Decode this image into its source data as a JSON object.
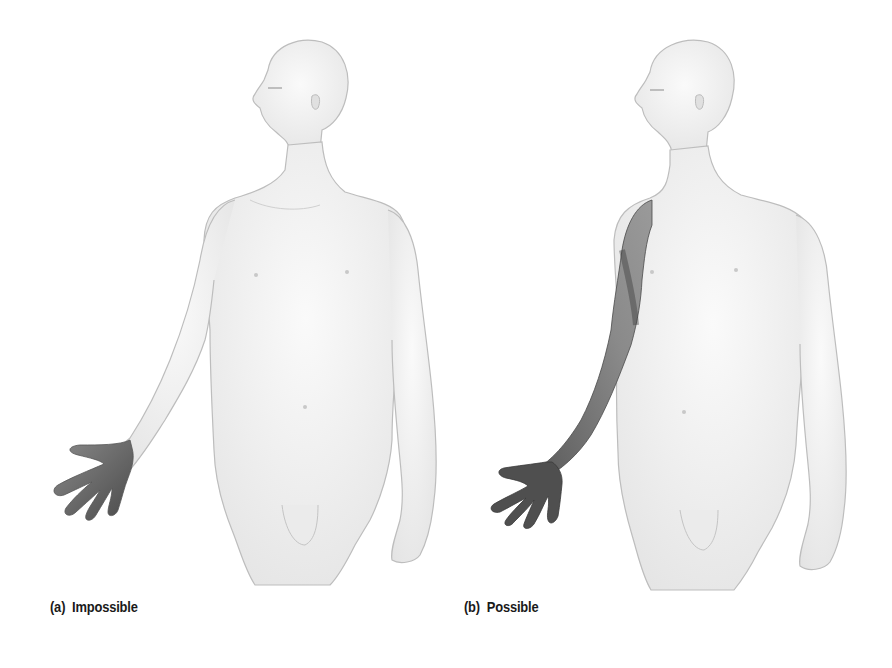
{
  "figure": {
    "panels": [
      {
        "id": "a",
        "caption": "(a)  Impossible",
        "highlighted_region": "hand only",
        "highlight_color": "#6e6e6e"
      },
      {
        "id": "b",
        "caption": "(b)  Possible",
        "highlighted_region": "hand and entire arm to shoulder",
        "highlight_color": "#6e6e6e"
      }
    ],
    "body_color": "#f2f2f2",
    "outline_color": "#bdbdbd"
  }
}
